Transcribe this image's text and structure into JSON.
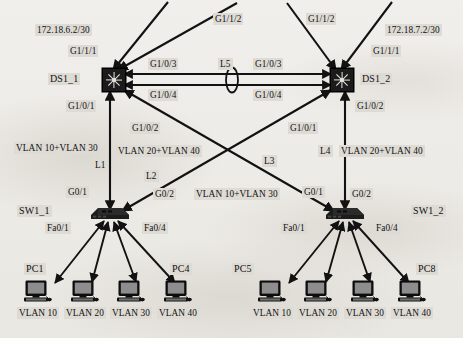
{
  "diagram": {
    "type": "network-topology",
    "background_color": "#eceae6",
    "ink_color": "#111111",
    "label_chip_color": "#dedbd5"
  },
  "devices": {
    "distribution_switches": [
      {
        "id": "DS1_1",
        "name": "DS1_1",
        "kind": "multilayer-switch",
        "x": 113,
        "y": 79
      },
      {
        "id": "DS1_2",
        "name": "DS1_2",
        "kind": "multilayer-switch",
        "x": 341,
        "y": 79
      }
    ],
    "access_switches": [
      {
        "id": "SW1_1",
        "name": "SW1_1",
        "kind": "switch",
        "x": 110,
        "y": 215
      },
      {
        "id": "SW1_2",
        "name": "SW1_2",
        "kind": "switch",
        "x": 345,
        "y": 215
      }
    ],
    "hosts": [
      {
        "id": "PC1",
        "name": "PC1",
        "vlan": "VLAN 10",
        "x": 38,
        "y": 292,
        "show_name": true
      },
      {
        "id": "PC2",
        "name": "PC2",
        "vlan": "VLAN 20",
        "x": 85,
        "y": 292,
        "show_name": false
      },
      {
        "id": "PC3",
        "name": "PC3",
        "vlan": "VLAN 30",
        "x": 131,
        "y": 292,
        "show_name": false
      },
      {
        "id": "PC4",
        "name": "PC4",
        "vlan": "VLAN 40",
        "x": 178,
        "y": 292,
        "show_name": true
      },
      {
        "id": "PC5",
        "name": "PC5",
        "vlan": "VLAN 10",
        "x": 272,
        "y": 292,
        "show_name": true
      },
      {
        "id": "PC6",
        "name": "PC6",
        "vlan": "VLAN 20",
        "x": 318,
        "y": 292,
        "show_name": false
      },
      {
        "id": "PC7",
        "name": "PC7",
        "vlan": "VLAN 30",
        "x": 365,
        "y": 292,
        "show_name": false
      },
      {
        "id": "PC8",
        "name": "PC8",
        "vlan": "VLAN 40",
        "x": 412,
        "y": 292,
        "show_name": true
      }
    ]
  },
  "device_labels": {
    "ds1_1": "DS1_1",
    "ds1_2": "DS1_2",
    "sw1_1": "SW1_1",
    "sw1_2": "SW1_2",
    "pc1": "PC1",
    "pc4": "PC4",
    "pc5": "PC5",
    "pc8": "PC8"
  },
  "subnets": [
    {
      "id": "left-uplink",
      "label": "172.18.6.2/30"
    },
    {
      "id": "right-uplink",
      "label": "172.18.7.2/30"
    }
  ],
  "interfaces": {
    "ds1_1_g1_1_1": "G1/1/1",
    "ds1_1_g1_1_2": "G1/1/2",
    "ds1_1_g1_0_3": "G1/0/3",
    "ds1_1_g1_0_4": "G1/0/4",
    "ds1_1_g1_0_1": "G1/0/1",
    "ds1_1_g1_0_2": "G1/0/2",
    "ds1_2_g1_1_1": "G1/1/1",
    "ds1_2_g1_1_2": "G1/1/2",
    "ds1_2_g1_0_3": "G1/0/3",
    "ds1_2_g1_0_4": "G1/0/4",
    "ds1_2_g1_0_1": "G1/0/1",
    "ds1_2_g1_0_2": "G1/0/2",
    "sw1_1_g0_1": "G0/1",
    "sw1_1_g0_2": "G0/2",
    "sw1_1_fa0_1": "Fa0/1",
    "sw1_1_fa0_4": "Fa0/4",
    "sw1_2_g0_1": "G0/1",
    "sw1_2_g0_2": "G0/2",
    "sw1_2_fa0_1": "Fa0/1",
    "sw1_2_fa0_4": "Fa0/4"
  },
  "links": [
    {
      "id": "L1",
      "label": "L1",
      "from": "DS1_1",
      "to": "SW1_1",
      "vlans": "VLAN 10+VLAN 30"
    },
    {
      "id": "L2",
      "label": "L2",
      "from": "DS1_2",
      "to": "SW1_1",
      "vlans": "VLAN 20+VLAN 40"
    },
    {
      "id": "L3",
      "label": "L3",
      "from": "DS1_1",
      "to": "SW1_2",
      "vlans": "VLAN 10+VLAN 30"
    },
    {
      "id": "L4",
      "label": "L4",
      "from": "DS1_2",
      "to": "SW1_2",
      "vlans": "VLAN 20+VLAN 40"
    },
    {
      "id": "L5",
      "label": "L5",
      "from": "DS1_1",
      "to": "DS1_2",
      "vlans": ""
    }
  ],
  "link_labels": {
    "l1": "L1",
    "l2": "L2",
    "l3": "L3",
    "l4": "L4",
    "l5": "L5"
  },
  "vlan_trunk_labels": {
    "left_l1": "VLAN 10+VLAN 30",
    "left_l2": "VLAN 20+VLAN 40",
    "right_l3": "VLAN 10+VLAN 30",
    "right_l4": "VLAN 20+VLAN 40"
  },
  "host_vlan_labels": {
    "left": [
      "VLAN 10",
      "VLAN 20",
      "VLAN 30",
      "VLAN 40"
    ],
    "right": [
      "VLAN 10",
      "VLAN 20",
      "VLAN 30",
      "VLAN 40"
    ]
  }
}
